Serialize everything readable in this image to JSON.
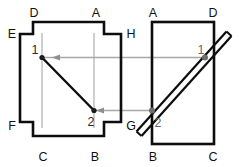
{
  "figure": {
    "background_color": "#ffffff",
    "outline_color": "#0d0d0d",
    "projection_color": "#a8a8a8",
    "point_label_color": "#6a6a6a"
  },
  "left_view": {
    "name": "front-view-cross-shape",
    "vertex_labels": {
      "top_left": "D",
      "top_right": "A",
      "upper_left": "E",
      "upper_right": "H",
      "lower_left": "F",
      "lower_right": "G",
      "bottom_left": "C",
      "bottom_right": "B"
    },
    "point_labels": {
      "p1": "1",
      "p2": "2"
    }
  },
  "right_view": {
    "name": "side-view-rectangle",
    "vertex_labels": {
      "top_left": "A",
      "top_right": "D",
      "bottom_left": "B",
      "bottom_right": "C"
    },
    "point_labels": {
      "p1": "1",
      "p2": "2"
    }
  },
  "projection_lines": {
    "upper": {
      "name": "projection-line-point-1",
      "direction": "right-to-left"
    },
    "lower": {
      "name": "projection-line-point-2",
      "direction": "right-to-left"
    }
  }
}
